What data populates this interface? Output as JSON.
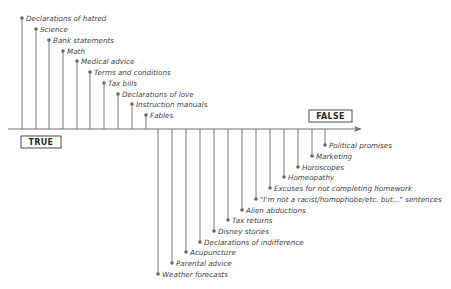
{
  "diagram": {
    "axis": {
      "y": 129,
      "x_start": 8,
      "x_end": 362,
      "line_color": "#6e6e6e",
      "left_label": "TRUE",
      "right_label": "FALSE"
    },
    "true_items": [
      {
        "label": "Declarations of hatred",
        "x": 22,
        "y": 18
      },
      {
        "label": "Science",
        "x": 36,
        "y": 29
      },
      {
        "label": "Bank statements",
        "x": 49,
        "y": 40
      },
      {
        "label": "Math",
        "x": 63,
        "y": 51
      },
      {
        "label": "Medical advice",
        "x": 77,
        "y": 61
      },
      {
        "label": "Terms and conditions",
        "x": 90,
        "y": 72
      },
      {
        "label": "Tax bills",
        "x": 104,
        "y": 83
      },
      {
        "label": "Declarations of love",
        "x": 118,
        "y": 94
      },
      {
        "label": "Instruction manuals",
        "x": 132,
        "y": 104
      },
      {
        "label": "Fables",
        "x": 146,
        "y": 115
      }
    ],
    "false_items": [
      {
        "label": "Political promises",
        "x": 325,
        "y": 145
      },
      {
        "label": "Marketing",
        "x": 312,
        "y": 156
      },
      {
        "label": "Horoscopes",
        "x": 298,
        "y": 167
      },
      {
        "label": "Homeopathy",
        "x": 284,
        "y": 177
      },
      {
        "label": "Excuses for not completing homework",
        "x": 270,
        "y": 188
      },
      {
        "label": "\"I'm not a racist/homophobe/etc. but...\" sentences",
        "x": 256,
        "y": 199
      },
      {
        "label": "Alien abductions",
        "x": 242,
        "y": 210
      },
      {
        "label": "Tax returns",
        "x": 228,
        "y": 220
      },
      {
        "label": "Disney stories",
        "x": 214,
        "y": 231
      },
      {
        "label": "Declarations of indifference",
        "x": 200,
        "y": 242
      },
      {
        "label": "Acupuncture",
        "x": 186,
        "y": 252
      },
      {
        "label": "Parental advice",
        "x": 172,
        "y": 263
      },
      {
        "label": "Weather forecasts",
        "x": 158,
        "y": 274
      }
    ],
    "colors": {
      "stem": "#7a7a7a",
      "dot": "#6a6a6a",
      "text": "#3f3f3f",
      "box_border": "#4a4a4a"
    }
  }
}
